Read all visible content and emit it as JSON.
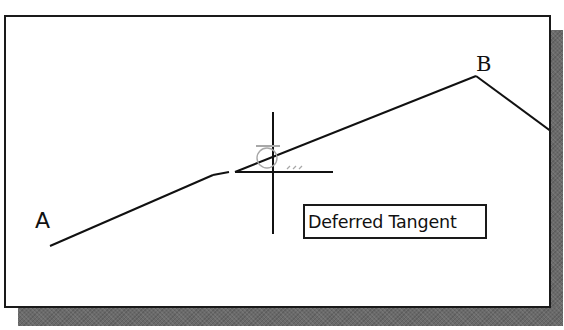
{
  "drawing": {
    "points": {
      "a": {
        "label": "A",
        "x": 50,
        "y": 246
      },
      "b": {
        "label": "B",
        "x": 476,
        "y": 76
      }
    },
    "segments": [
      {
        "name": "line-a-to-b",
        "from": [
          50,
          246
        ],
        "to": [
          476,
          76
        ],
        "break": {
          "x1": 213,
          "y1": 175,
          "x2": 235,
          "y2": 172
        }
      },
      {
        "name": "line-b-to-right",
        "from": [
          476,
          76
        ],
        "to": [
          548,
          130
        ]
      }
    ],
    "crosshair": {
      "center_x": 273,
      "center_y": 172,
      "vertical": {
        "y1": 112,
        "y2": 234
      },
      "horizontal": {
        "x1": 235,
        "x2": 333
      }
    },
    "snap_marker": {
      "type": "deferred-tangent",
      "color": "#a8a8a8"
    }
  },
  "tooltip": {
    "text": "Deferred Tangent"
  },
  "colors": {
    "line": "#111111",
    "frame_border": "#1a1a1a",
    "shadow": "#6a6a6a",
    "background": "#ffffff",
    "snap_marker": "#a8a8a8"
  }
}
